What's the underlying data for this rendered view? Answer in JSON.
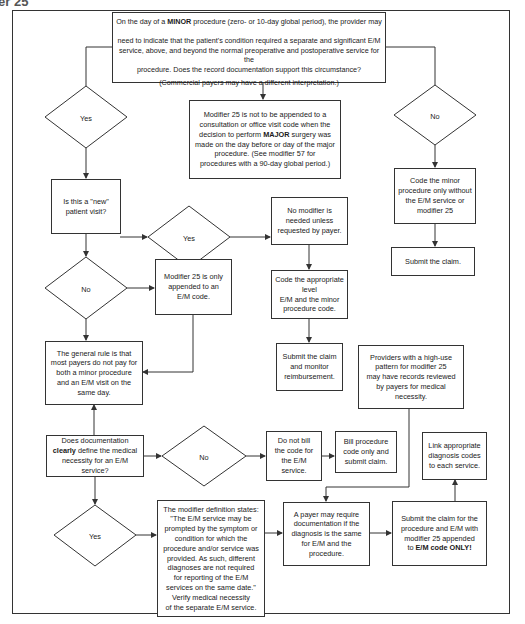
{
  "heading": "er 25",
  "nodes": {
    "start": {
      "line1_pre": "On the day of a ",
      "line1_bold": "MINOR",
      "line1_post": " procedure (zero- or 10-day global period), the provider may",
      "rest": "need to indicate that the patient's condition required a separate and significant E/M\nservice, above, and beyond the normal preoperative and postoperative service for the\nprocedure.  Does the record documentation support this circumstance?",
      "note": "(Commercial payers may have a different interpretation.)"
    },
    "major_note": {
      "pre": "Modifier 25 is not to be appended to a\nconsultation or office visit code when the\ndecision to perform ",
      "bold": "MAJOR",
      "post": " surgery was\nmade on the day before or day of the major\nprocedure.  (See modifier 57 for\nprocedures with a 90-day global period.)"
    },
    "yes_1": "Yes",
    "no_1": "No",
    "new_patient": "Is this a \"new\"\npatient visit?",
    "yes_2": "Yes",
    "no_modifier": "No modifier is\nneeded unless\nrequested by payer.",
    "code_minor_only": "Code the minor\nprocedure only without\nthe E/M service or\nmodifier 25",
    "submit_claim": "Submit the claim.",
    "no_3": "No",
    "modifier_only_em": "Modifier 25 is only\nappended to an\nE/M code.",
    "code_appropriate": "Code the appropriate\nlevel\nE/M and the minor\nprocedure code.",
    "general_rule": "The general rule is that\nmost payers do not pay for\nboth a minor procedure\nand an E/M visit on the\nsame day.",
    "submit_monitor": "Submit the claim\nand monitor\nreimbursement.",
    "high_use": "Providers with a high-use\npattern for modifier 25\nmay have records reviewed\nby payers for medical\nnecessity.",
    "documentation": {
      "pre": "Does documentation\n",
      "bold": "clearly",
      "post": " define the medical\nnecessity for an E/M\nservice?"
    },
    "no_4": "No",
    "do_not_bill": "Do not bill\nthe code for\nthe E/M\nservice.",
    "bill_procedure": "Bill procedure\ncode only and\nsubmit claim.",
    "link_diagnosis": "Link appropriate\ndiagnosis codes\nto each service.",
    "yes_5": "Yes",
    "definition": "The modifier definition states:\n\"The E/M service may be\nprompted by the symptom or\ncondition for which the\nprocedure and/or service was\nprovided.  As such, different\ndiagnoses are not required\nfor reporting of the E/M\nservices on the same date.\"\nVerify medical necessity\nof the separate E/M service.",
    "payer_require": "A payer may require\ndocumentation if the\ndiagnosis is the same\nfor E/M and the\nprocedure.",
    "submit_final": {
      "pre": "Submit the claim for the\nprocedure and E/M with\nmodifier 25 appended\nto ",
      "bold": "E/M code ONLY!"
    }
  }
}
